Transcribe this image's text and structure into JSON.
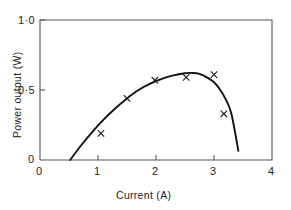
{
  "chart_data": {
    "type": "scatter",
    "title": "",
    "subtitle": "",
    "xlabel": "Current  (A)",
    "ylabel": "Power output (W)",
    "xlim": [
      0,
      4
    ],
    "ylim": [
      0,
      1.0
    ],
    "grid": false,
    "legend": null,
    "x_ticks": [
      {
        "value": 0,
        "label": "0"
      },
      {
        "value": 1,
        "label": "1"
      },
      {
        "value": 2,
        "label": "2"
      },
      {
        "value": 3,
        "label": "3"
      },
      {
        "value": 4,
        "label": "4"
      }
    ],
    "y_ticks": [
      {
        "value": 0,
        "label": "0"
      },
      {
        "value": 0.5,
        "label": "0·5"
      },
      {
        "value": 1.0,
        "label": "1·0"
      }
    ],
    "series": [
      {
        "name": "measured points",
        "marker": "x",
        "x": [
          1.05,
          1.5,
          1.98,
          2.52,
          3.0,
          3.17
        ],
        "y": [
          0.19,
          0.44,
          0.57,
          0.59,
          0.61,
          0.33
        ]
      },
      {
        "name": "fitted curve",
        "marker": "none",
        "x": [
          0.52,
          0.7,
          0.9,
          1.1,
          1.3,
          1.5,
          1.7,
          1.9,
          2.1,
          2.3,
          2.5,
          2.62,
          2.75,
          2.9,
          3.0,
          3.1,
          3.2,
          3.3,
          3.42
        ],
        "y": [
          0.0,
          0.1,
          0.2,
          0.29,
          0.37,
          0.44,
          0.5,
          0.545,
          0.58,
          0.605,
          0.62,
          0.622,
          0.615,
          0.585,
          0.555,
          0.505,
          0.435,
          0.33,
          0.065
        ]
      }
    ],
    "marker_color": "#1a1a1a",
    "curve_color": "#111111",
    "axis_color": "#4a4a4a",
    "background": "#ffffff"
  }
}
